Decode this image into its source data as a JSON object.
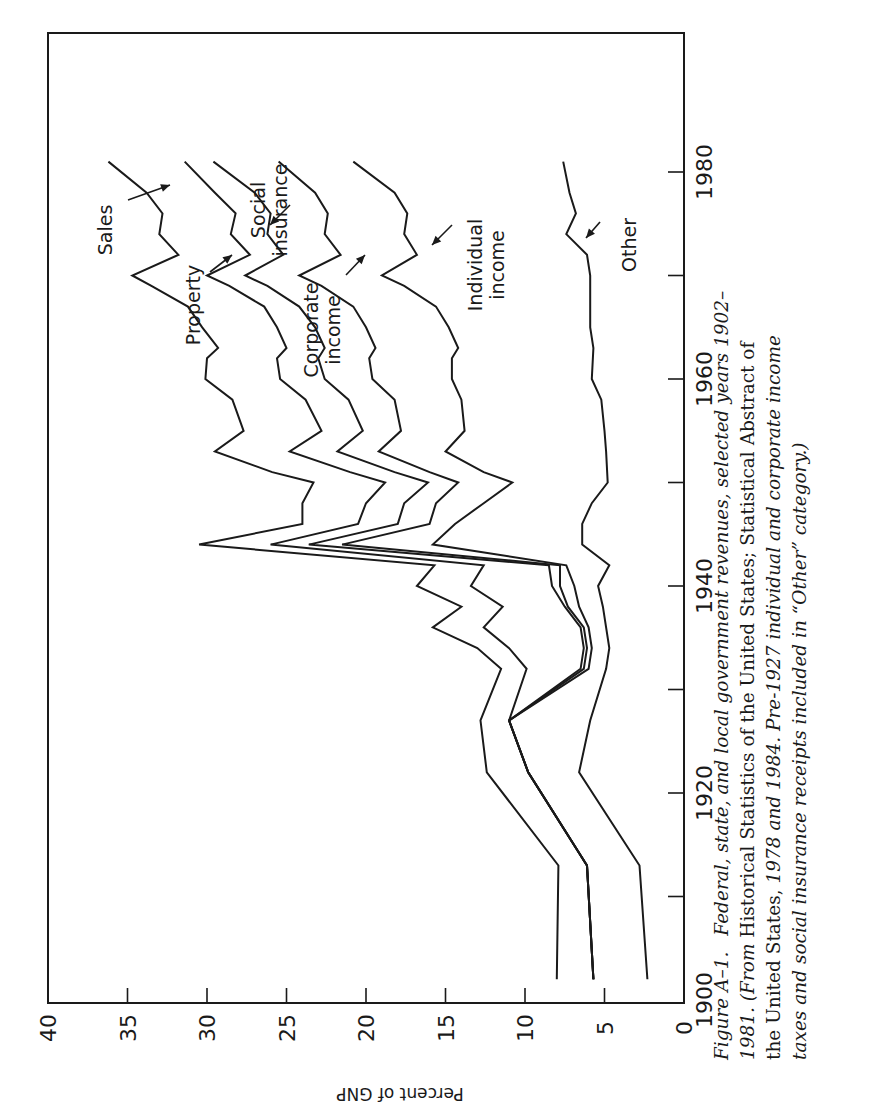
{
  "chart_data": {
    "type": "line",
    "orientation": "rotated-90-ccw",
    "xlabel": "",
    "ylabel": "Percent of GNP",
    "xlim": [
      1900,
      1993
    ],
    "ylim": [
      0,
      40
    ],
    "x_ticks": [
      1900,
      1910,
      1920,
      1930,
      1940,
      1950,
      1960,
      1970,
      1980
    ],
    "x_tick_labels": [
      "1900",
      "1920",
      "1940",
      "1960",
      "1980"
    ],
    "y_ticks": [
      0,
      5,
      10,
      15,
      20,
      25,
      30,
      35,
      40
    ],
    "y_tick_labels": [
      "0",
      "5",
      "10",
      "15",
      "20",
      "25",
      "30",
      "35",
      "40"
    ],
    "grid": false,
    "note": "Lines are cumulative (stacked) totals; top line = Sales (total), labels with arrows identify bands.",
    "series": [
      {
        "name": "Sales",
        "x": [
          1902,
          1913,
          1922,
          1927,
          1932,
          1934,
          1936,
          1938,
          1940,
          1942,
          1944,
          1946,
          1948,
          1950,
          1951,
          1953,
          1955,
          1958,
          1960,
          1962,
          1963,
          1965,
          1967,
          1969,
          1970,
          1972,
          1974,
          1976,
          1978,
          1981
        ],
        "values": [
          8.0,
          7.9,
          12.4,
          12.8,
          11.5,
          13.0,
          15.8,
          14.0,
          16.8,
          15.7,
          30.5,
          24.0,
          24.0,
          23.3,
          25.9,
          29.5,
          27.7,
          28.4,
          30.1,
          30.0,
          29.3,
          30.3,
          31.2,
          33.5,
          34.7,
          31.8,
          33.0,
          32.8,
          33.8,
          36.2
        ]
      },
      {
        "name": "Property",
        "x": [
          1902,
          1913,
          1922,
          1927,
          1932,
          1934,
          1936,
          1938,
          1940,
          1942,
          1944,
          1946,
          1948,
          1950,
          1951,
          1953,
          1955,
          1958,
          1960,
          1962,
          1963,
          1965,
          1967,
          1969,
          1970,
          1972,
          1974,
          1976,
          1978,
          1981
        ],
        "values": [
          5.7,
          6.1,
          9.8,
          11.0,
          9.9,
          11.0,
          12.6,
          11.4,
          13.4,
          12.6,
          26.0,
          20.5,
          20.0,
          18.8,
          21.0,
          24.8,
          22.8,
          23.8,
          25.4,
          25.6,
          25.0,
          25.6,
          26.4,
          28.6,
          30.0,
          27.3,
          28.5,
          28.2,
          29.5,
          31.4
        ]
      },
      {
        "name": "Social insurance",
        "x": [
          1902,
          1913,
          1922,
          1927,
          1932,
          1934,
          1936,
          1938,
          1940,
          1942,
          1944,
          1946,
          1948,
          1950,
          1951,
          1953,
          1955,
          1958,
          1960,
          1962,
          1963,
          1965,
          1967,
          1969,
          1970,
          1972,
          1974,
          1976,
          1978,
          1981
        ],
        "values": [
          5.7,
          6.1,
          9.8,
          11.0,
          6.5,
          6.3,
          6.5,
          7.5,
          8.3,
          8.5,
          23.6,
          18.0,
          17.6,
          16.1,
          18.2,
          21.8,
          20.2,
          21.1,
          22.6,
          23.0,
          22.6,
          23.2,
          24.2,
          26.2,
          27.6,
          25.2,
          26.2,
          26.0,
          27.0,
          29.6
        ]
      },
      {
        "name": "Corporate income",
        "x": [
          1902,
          1913,
          1922,
          1927,
          1932,
          1934,
          1936,
          1938,
          1940,
          1942,
          1944,
          1946,
          1948,
          1950,
          1951,
          1953,
          1955,
          1958,
          1960,
          1962,
          1963,
          1965,
          1967,
          1969,
          1970,
          1972,
          1974,
          1976,
          1978,
          1981
        ],
        "values": [
          5.7,
          6.1,
          9.8,
          11.0,
          6.3,
          6.1,
          6.3,
          7.3,
          7.8,
          7.8,
          21.5,
          16.0,
          15.6,
          14.2,
          16.0,
          19.2,
          17.8,
          18.2,
          19.6,
          19.8,
          19.4,
          20.0,
          20.8,
          22.8,
          24.2,
          21.6,
          22.6,
          22.4,
          23.2,
          25.5
        ]
      },
      {
        "name": "Individual income",
        "x": [
          1902,
          1913,
          1922,
          1927,
          1932,
          1934,
          1936,
          1938,
          1940,
          1942,
          1944,
          1946,
          1948,
          1950,
          1951,
          1953,
          1955,
          1958,
          1960,
          1962,
          1963,
          1965,
          1967,
          1969,
          1970,
          1972,
          1974,
          1976,
          1978,
          1981
        ],
        "values": [
          5.7,
          6.1,
          9.8,
          11.0,
          6.0,
          5.8,
          6.0,
          6.6,
          6.9,
          7.4,
          15.8,
          14.4,
          12.6,
          10.8,
          12.6,
          15.0,
          13.8,
          14.0,
          14.6,
          14.6,
          14.2,
          14.8,
          15.6,
          17.6,
          19.0,
          16.8,
          17.6,
          17.4,
          18.2,
          20.8
        ]
      },
      {
        "name": "Other",
        "x": [
          1902,
          1913,
          1922,
          1927,
          1932,
          1934,
          1936,
          1938,
          1940,
          1942,
          1944,
          1946,
          1948,
          1950,
          1953,
          1955,
          1958,
          1960,
          1963,
          1965,
          1967,
          1970,
          1972,
          1974,
          1976,
          1978,
          1981
        ],
        "values": [
          2.3,
          2.8,
          6.6,
          5.9,
          4.9,
          4.7,
          4.9,
          5.1,
          5.4,
          4.7,
          6.4,
          6.4,
          5.8,
          4.8,
          4.9,
          5.0,
          5.2,
          5.8,
          5.7,
          5.9,
          5.9,
          5.9,
          6.1,
          7.4,
          6.8,
          7.2,
          7.6
        ]
      }
    ],
    "labels": [
      {
        "text": [
          "Sales"
        ],
        "series": "Sales"
      },
      {
        "text": [
          "Property"
        ],
        "series": "Property"
      },
      {
        "text": [
          "Social",
          "insurance"
        ],
        "series": "Social insurance"
      },
      {
        "text": [
          "Corporate",
          "income"
        ],
        "series": "Corporate income"
      },
      {
        "text": [
          "Individual",
          "income"
        ],
        "series": "Individual income"
      },
      {
        "text": [
          "Other"
        ],
        "series": "Other"
      }
    ]
  },
  "caption": {
    "figure_number": "Figure A–1.",
    "line1_italic": "Federal, state, and local government revenues, selected years 1902–",
    "line2_italic_a": "1981. (From ",
    "line2_roman": "Historical Statistics of the United States; Statistical Abstract of",
    "line3_roman": "the United States, ",
    "line3_italic": "1978 and 1984. Pre-1927 individual and corporate income",
    "line4_italic": "taxes and social insurance receipts included in “Other” category.)"
  }
}
